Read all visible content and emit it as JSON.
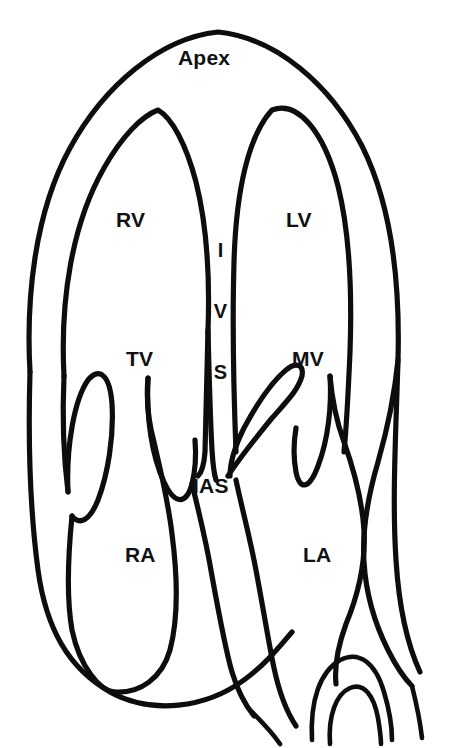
{
  "figure": {
    "type": "anatomical-line-diagram",
    "background_color": "#ffffff",
    "stroke_color": "#0d0d0d",
    "label_color": "#111111"
  },
  "labels": {
    "apex": "Apex",
    "right_ventricle": "RV",
    "left_ventricle": "LV",
    "interventricular_septum": "IVS",
    "interventricular_septum_letters": [
      "I",
      "V",
      "S"
    ],
    "tricuspid_valve": "TV",
    "mitral_valve": "MV",
    "interatrial_septum": "IAS",
    "right_atrium": "RA",
    "left_atrium": "LA"
  }
}
